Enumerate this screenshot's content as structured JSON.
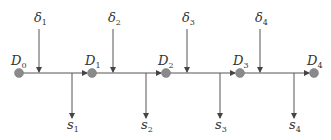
{
  "diagram": {
    "nodes": [
      {
        "label": "D",
        "sub": "0",
        "x": 19,
        "y": 73
      },
      {
        "label": "D",
        "sub": "1",
        "x": 92,
        "y": 73
      },
      {
        "label": "D",
        "sub": "2",
        "x": 166,
        "y": 73
      },
      {
        "label": "D",
        "sub": "3",
        "x": 240,
        "y": 73
      },
      {
        "label": "D",
        "sub": "4",
        "x": 314,
        "y": 73
      }
    ],
    "inputs": [
      {
        "label": "δ",
        "sub": "1"
      },
      {
        "label": "δ",
        "sub": "2"
      },
      {
        "label": "δ",
        "sub": "3"
      },
      {
        "label": "δ",
        "sub": "4"
      }
    ],
    "outputs": [
      {
        "label": "s",
        "sub": "1"
      },
      {
        "label": "s",
        "sub": "2"
      },
      {
        "label": "s",
        "sub": "3"
      },
      {
        "label": "s",
        "sub": "4"
      }
    ],
    "colors": {
      "node": "#8a8a8a",
      "line": "#555555"
    }
  }
}
